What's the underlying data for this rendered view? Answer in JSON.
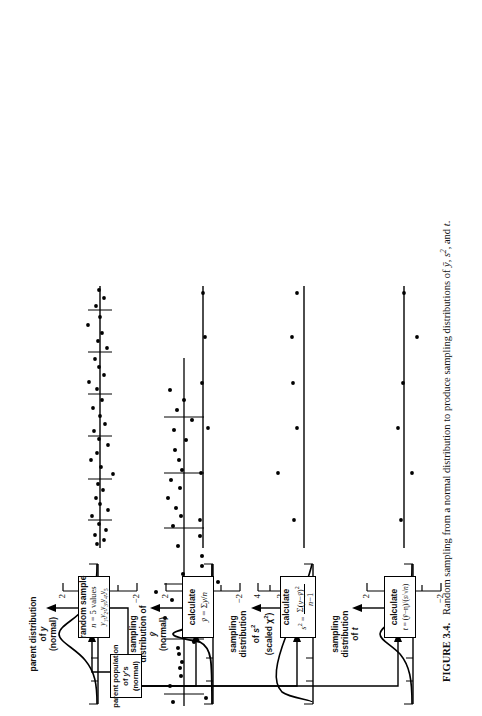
{
  "figure": {
    "caption_label": "FIGURE 3.4.",
    "caption_text": "Random sampling from a normal distribution to produce sampling distributions of",
    "caption_tail": ", and",
    "caption_symbols": [
      "ȳ",
      "s²",
      "t"
    ],
    "caption_full": "FIGURE 3.4.  Random sampling from a normal distribution to produce sampling distributions of ȳ, s², and t."
  },
  "flow": {
    "source_box": {
      "line1": "parent population",
      "line2": "of y's",
      "line3": "(normal)"
    },
    "boxes": [
      {
        "id": "random-sample",
        "line1": "random sample",
        "line2": "n = 5 values",
        "line3": "y₁, y₂, y₃, y₄, y₅"
      },
      {
        "id": "calculate-ybar",
        "line1": "calculate",
        "line2": "ȳ = Σy/n",
        "line3": ""
      },
      {
        "id": "calculate-s2",
        "line1": "calculate",
        "line2_lhs": "s² =",
        "numerator": "Σ(y−ȳ)²",
        "denominator": "n−1",
        "line3": ""
      },
      {
        "id": "calculate-t",
        "line1": "calculate",
        "line2": "t = (ȳ−η)/(s/√n)",
        "line3": ""
      }
    ]
  },
  "panels": [
    {
      "id": "parent-distribution",
      "label_lines": [
        "parent distribution",
        "of y",
        "(normal)"
      ],
      "curve": "normal-wide",
      "axis": {
        "ticks": [
          -3,
          -2,
          -1,
          0,
          1,
          2,
          3
        ],
        "labels": [
          "",
          "−2",
          "",
          "0",
          "",
          "2",
          ""
        ],
        "min": -3.2,
        "max": 3.2
      },
      "group_separators": 6,
      "points": [
        0.45,
        -0.95,
        0.55,
        0.1,
        0.12,
        0.02,
        0.18,
        0.2,
        -0.3,
        -0.35,
        -0.18,
        0.7,
        -0.4,
        0.5,
        1.0,
        -1.35,
        0.05,
        -0.55,
        -0.55,
        0.22,
        -0.5,
        0.38,
        0.1,
        0.25,
        0.6,
        0.12,
        0.48,
        0.05,
        0.18
      ]
    },
    {
      "id": "sampling-distribution-ybar",
      "label_lines": [
        "sampling",
        "distribution of",
        "ȳ",
        "(normal)"
      ],
      "curve": "normal-narrow",
      "axis": {
        "ticks": [
          -3,
          -2,
          -1,
          0,
          1,
          2,
          3
        ],
        "labels": [
          "",
          "−2",
          "",
          "0",
          "",
          "2",
          ""
        ],
        "min": -3.2,
        "max": 3.2
      },
      "points": [
        0.1,
        0.08,
        -0.45,
        0.05,
        -0.12,
        0.0
      ]
    },
    {
      "id": "sampling-distribution-s2",
      "label_lines": [
        "sampling",
        "distribution",
        "of s²",
        "(scaled χ²)"
      ],
      "curve": "chi-square",
      "axis": {
        "ticks": [
          0,
          1,
          2,
          3,
          4,
          5
        ],
        "labels": [
          "0",
          "",
          "2",
          "",
          "4",
          ""
        ],
        "min": 0,
        "max": 5.2
      },
      "points": [
        0.7,
        1.85,
        0.55,
        0.75,
        0.8,
        0.55
      ]
    },
    {
      "id": "sampling-distribution-t",
      "label_lines": [
        "sampling",
        "distribution",
        "of t"
      ],
      "curve": "t-dist",
      "axis": {
        "ticks": [
          -3,
          -2,
          -1,
          0,
          1,
          2,
          3
        ],
        "labels": [
          "",
          "−2",
          "",
          "0",
          "",
          "2",
          ""
        ],
        "min": -3.2,
        "max": 3.2
      },
      "points": [
        0.1,
        -0.85,
        0.55,
        0.05,
        -1.3,
        0.0
      ]
    }
  ],
  "colors": {
    "ink": "#000000",
    "paper": "#ffffff"
  }
}
